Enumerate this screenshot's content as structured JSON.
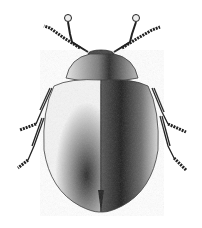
{
  "image": {
    "subject": "beetle",
    "style": "stippled black-and-white scientific illustration",
    "view": "dorsal",
    "background": "#ffffff",
    "ink": "#1a1a1a",
    "parts": [
      "antennae",
      "head",
      "pronotum",
      "elytra",
      "legs"
    ]
  }
}
